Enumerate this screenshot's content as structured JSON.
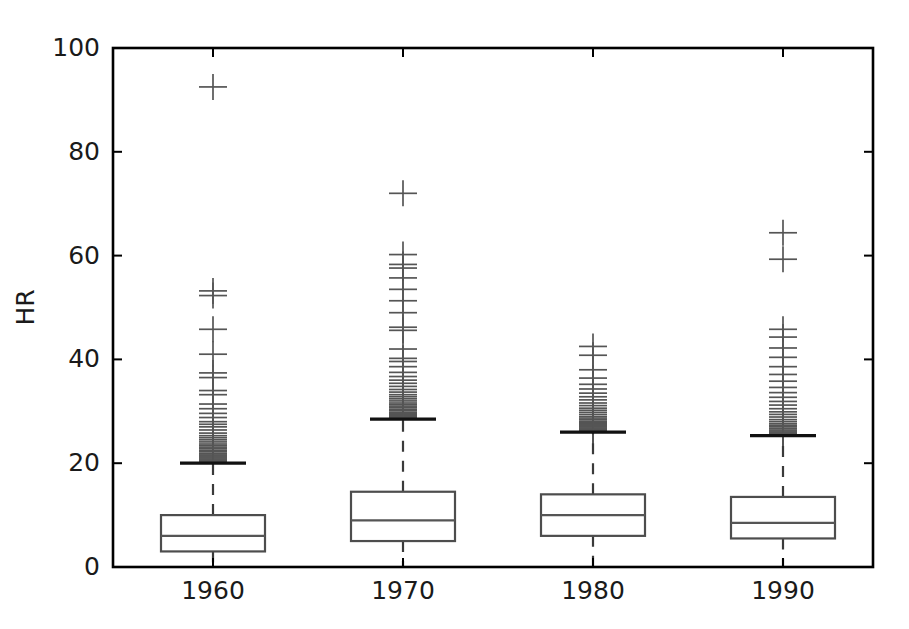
{
  "chart_data": {
    "type": "box",
    "title": "",
    "xlabel": "",
    "ylabel": "HR",
    "categories": [
      "1960",
      "1970",
      "1980",
      "1990"
    ],
    "xtick_labels": [
      "1960",
      "1970",
      "1980",
      "1990"
    ],
    "ytick_labels": [
      "0",
      "20",
      "40",
      "60",
      "80",
      "100"
    ],
    "yticks": [
      0,
      20,
      40,
      60,
      80,
      100
    ],
    "ylim": [
      0,
      100
    ],
    "xlim": [
      0,
      5
    ],
    "grid": false,
    "legend": null,
    "frame": {
      "left": 113,
      "top": 48,
      "right": 873,
      "bottom": 567
    },
    "marker": "plus",
    "marker_color": "#555555",
    "box_edge_color": "#4d4d4d",
    "median_color": "#555555",
    "whisker_color": "#3a3a3a",
    "cap_color": "#111111",
    "axis_color": "#000000",
    "background_color": "#ffffff",
    "boxes": [
      {
        "label": "1960",
        "x_center": 213,
        "box_width": 104,
        "q1": 3.0,
        "median": 6.0,
        "q3": 10.0,
        "whisker_low": 0.2,
        "whisker_high": 20.0,
        "fliers": [
          92.5,
          53.2,
          52.3,
          45.8,
          41.0,
          37.4,
          36.5,
          34.0,
          33.2,
          31.4,
          30.5,
          29.6,
          28.8,
          28.0,
          27.5,
          27.0,
          26.4,
          25.8,
          25.3,
          24.9,
          24.5,
          24.1,
          23.7,
          23.4,
          23.1,
          22.8,
          22.5,
          22.2,
          21.9,
          21.6,
          21.4,
          21.2,
          21.0,
          20.8,
          20.6,
          20.4,
          20.3
        ]
      },
      {
        "label": "1970",
        "x_center": 403,
        "box_width": 104,
        "q1": 5.0,
        "median": 9.0,
        "q3": 14.5,
        "whisker_low": 0.2,
        "whisker_high": 28.5,
        "fliers": [
          72.0,
          60.2,
          58.3,
          57.6,
          55.7,
          53.5,
          51.3,
          49.0,
          46.2,
          45.6,
          42.0,
          40.2,
          39.6,
          38.6,
          37.5,
          36.7,
          36.0,
          35.4,
          34.8,
          34.2,
          33.7,
          33.2,
          32.8,
          32.4,
          32.0,
          31.6,
          31.3,
          31.0,
          30.7,
          30.4,
          30.1,
          29.8,
          29.6,
          29.4,
          29.2,
          29.0,
          28.8
        ]
      },
      {
        "label": "1980",
        "x_center": 593,
        "box_width": 104,
        "q1": 6.0,
        "median": 10.0,
        "q3": 14.0,
        "whisker_low": 0.2,
        "whisker_high": 26.0,
        "fliers": [
          42.5,
          40.8,
          38.0,
          36.4,
          35.2,
          34.3,
          33.5,
          32.8,
          32.2,
          31.6,
          31.1,
          30.6,
          30.2,
          29.8,
          29.4,
          29.0,
          28.7,
          28.4,
          28.1,
          27.8,
          27.6,
          27.4,
          27.2,
          27.0,
          26.8,
          26.6,
          26.5,
          26.4,
          26.3,
          26.2
        ]
      },
      {
        "label": "1990",
        "x_center": 783,
        "box_width": 104,
        "q1": 5.5,
        "median": 8.5,
        "q3": 13.5,
        "whisker_low": 0.2,
        "whisker_high": 25.3,
        "fliers": [
          64.4,
          59.3,
          45.8,
          44.3,
          42.2,
          40.4,
          38.6,
          37.1,
          35.8,
          34.6,
          33.6,
          32.7,
          31.9,
          31.2,
          30.5,
          29.9,
          29.4,
          28.9,
          28.4,
          28.0,
          27.6,
          27.3,
          27.0,
          26.7,
          26.4,
          26.2,
          26.0,
          25.8,
          25.7,
          25.6
        ]
      }
    ]
  }
}
